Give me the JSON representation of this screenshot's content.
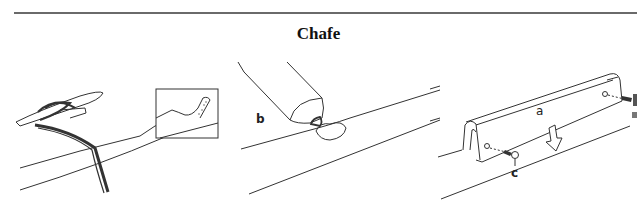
{
  "page": {
    "title": "Chafe"
  },
  "figures": [
    {
      "id": "left",
      "description": "rope on cleat with inset detail of chafed rope",
      "labels": []
    },
    {
      "id": "middle",
      "description": "tube applying compound to rail",
      "labels": [
        "b"
      ]
    },
    {
      "id": "right",
      "description": "chafe guard fastened with screws",
      "labels": [
        "a",
        "c"
      ]
    }
  ],
  "labels": {
    "b": "b",
    "a": "a",
    "c": "c"
  }
}
